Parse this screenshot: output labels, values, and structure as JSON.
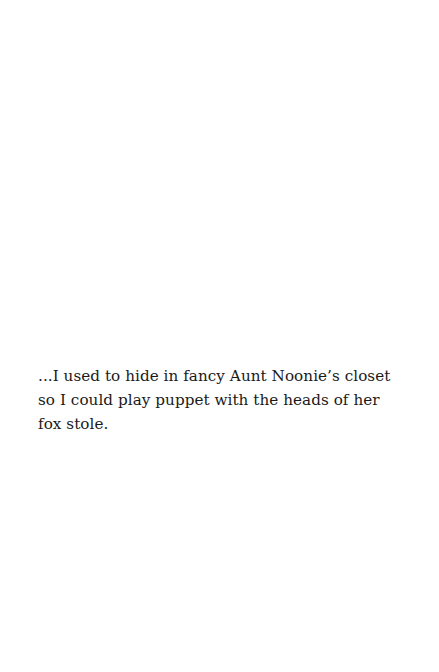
{
  "page": {
    "background": "#ffffff",
    "text_color": "#1a1a1a",
    "passage": {
      "lines": [
        "...I used to hide in fancy Aunt Noonie’s closet",
        "so I could play puppet with the heads of her",
        "fox stole."
      ]
    }
  }
}
